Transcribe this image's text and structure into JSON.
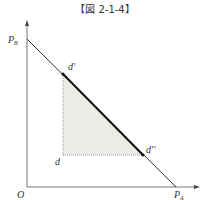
{
  "title": "【図 2-1-4】",
  "axes": {
    "origin_label": "O",
    "y_intercept_label": "P",
    "y_intercept_sub": "B",
    "x_intercept_label": "P",
    "x_intercept_sub": "A"
  },
  "points": {
    "d": "d",
    "d_prime": "d'",
    "d_double_prime": "d''"
  },
  "colors": {
    "line": "#333333",
    "axis": "#666666",
    "shade": "#ecebe6",
    "dotted": "#888888"
  },
  "geometry": {
    "origin": [
      27,
      187
    ],
    "y_axis_top": [
      27,
      21
    ],
    "x_axis_right": [
      199,
      187
    ],
    "PB": [
      27,
      39
    ],
    "PA": [
      176,
      187
    ],
    "d": [
      63,
      155
    ],
    "d_prime": [
      63,
      74
    ],
    "d_double_prime": [
      143,
      155
    ]
  }
}
